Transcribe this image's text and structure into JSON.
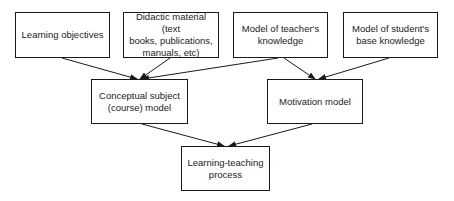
{
  "diagram": {
    "type": "flowchart",
    "colors": {
      "stroke": "#1a1a1a",
      "text": "#222222",
      "background": "#ffffff"
    },
    "nodes": [
      {
        "id": "learning-objectives",
        "label": "Learning objectives",
        "x": 15,
        "y": 12,
        "w": 95,
        "h": 46
      },
      {
        "id": "didactic-material",
        "label": "Didactic material (text\nbooks, publications,\nmanuals, etc)",
        "x": 123,
        "y": 12,
        "w": 96,
        "h": 46
      },
      {
        "id": "teacher-knowledge",
        "label": "Model of teacher's\nknowledge",
        "x": 233,
        "y": 12,
        "w": 95,
        "h": 46
      },
      {
        "id": "student-knowledge",
        "label": "Model of student's\nbase knowledge",
        "x": 343,
        "y": 12,
        "w": 95,
        "h": 46
      },
      {
        "id": "conceptual-model",
        "label": "Conceptual subject\n(course) model",
        "x": 91,
        "y": 79,
        "w": 97,
        "h": 45
      },
      {
        "id": "motivation-model",
        "label": "Motivation model",
        "x": 267,
        "y": 79,
        "w": 96,
        "h": 45
      },
      {
        "id": "learning-teaching",
        "label": "Learning-teaching\nprocess",
        "x": 181,
        "y": 146,
        "w": 89,
        "h": 45
      }
    ],
    "edges": [
      {
        "from": "learning-objectives",
        "to": "conceptual-model",
        "x1": 62,
        "y1": 58,
        "x2": 137,
        "y2": 79
      },
      {
        "from": "didactic-material",
        "to": "conceptual-model",
        "x1": 170,
        "y1": 58,
        "x2": 140,
        "y2": 79
      },
      {
        "from": "teacher-knowledge",
        "to": "conceptual-model",
        "x1": 278,
        "y1": 58,
        "x2": 142,
        "y2": 79
      },
      {
        "from": "teacher-knowledge",
        "to": "motivation-model",
        "x1": 284,
        "y1": 58,
        "x2": 315,
        "y2": 79
      },
      {
        "from": "student-knowledge",
        "to": "motivation-model",
        "x1": 389,
        "y1": 58,
        "x2": 319,
        "y2": 79
      },
      {
        "from": "conceptual-model",
        "to": "learning-teaching",
        "x1": 142,
        "y1": 124,
        "x2": 224,
        "y2": 146
      },
      {
        "from": "motivation-model",
        "to": "learning-teaching",
        "x1": 312,
        "y1": 124,
        "x2": 229,
        "y2": 146
      }
    ]
  }
}
